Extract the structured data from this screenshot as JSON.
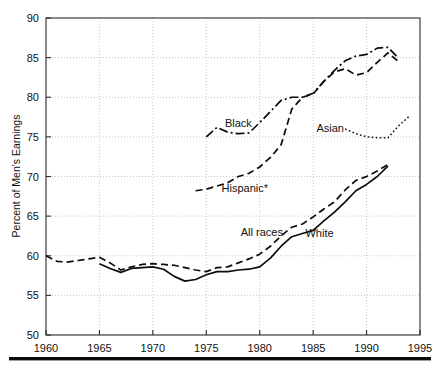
{
  "chart_data": {
    "type": "line",
    "title": "",
    "xlabel": "",
    "ylabel": "Percent of Men's Earnings",
    "xlim": [
      1960,
      1995
    ],
    "ylim": [
      50,
      90
    ],
    "xticks": [
      1960,
      1965,
      1970,
      1975,
      1980,
      1985,
      1990,
      1995
    ],
    "yticks": [
      50,
      55,
      60,
      65,
      70,
      75,
      80,
      85,
      90
    ],
    "grid": true,
    "legend": "inline-annotations",
    "annotations": [
      {
        "text": "Black",
        "x": 1978.0,
        "y": 76.3
      },
      {
        "text": "Hispanic*",
        "x": 1978.6,
        "y": 68.1
      },
      {
        "text": "Asian",
        "x": 1986.6,
        "y": 75.6
      },
      {
        "text": "All races",
        "x": 1980.2,
        "y": 62.5
      },
      {
        "text": "White",
        "x": 1985.6,
        "y": 62.4
      }
    ],
    "series": [
      {
        "name": "All races",
        "style": "dashed",
        "dasharray": "7 4",
        "width": 1.7,
        "x": [
          1960,
          1961,
          1962,
          1963,
          1964,
          1965,
          1966,
          1967,
          1968,
          1969,
          1970,
          1971,
          1972,
          1973,
          1974,
          1975,
          1976,
          1977,
          1978,
          1979,
          1980,
          1981,
          1982,
          1983,
          1984,
          1985,
          1986,
          1987,
          1988,
          1989,
          1990,
          1991,
          1992
        ],
        "y": [
          60.0,
          59.3,
          59.2,
          59.4,
          59.6,
          59.8,
          59.1,
          58.2,
          58.6,
          58.9,
          59.0,
          58.9,
          58.8,
          58.5,
          58.2,
          58.0,
          58.5,
          58.6,
          59.1,
          59.6,
          60.2,
          61.2,
          62.5,
          63.6,
          64.0,
          64.9,
          65.9,
          66.8,
          68.3,
          69.5,
          70.0,
          70.7,
          71.5
        ]
      },
      {
        "name": "White",
        "style": "solid",
        "dasharray": "none",
        "width": 1.7,
        "x": [
          1965,
          1966,
          1967,
          1968,
          1969,
          1970,
          1971,
          1972,
          1973,
          1974,
          1975,
          1976,
          1977,
          1978,
          1979,
          1980,
          1981,
          1982,
          1983,
          1984,
          1985,
          1986,
          1987,
          1988,
          1989,
          1990,
          1991,
          1992
        ],
        "y": [
          59.0,
          58.4,
          57.9,
          58.4,
          58.5,
          58.6,
          58.3,
          57.4,
          56.8,
          57.0,
          57.6,
          58.0,
          58.0,
          58.2,
          58.3,
          58.6,
          59.7,
          61.2,
          62.4,
          62.8,
          63.2,
          64.4,
          65.5,
          66.8,
          68.2,
          69.0,
          70.0,
          71.3
        ]
      },
      {
        "name": "Black",
        "style": "dash-dot",
        "dasharray": "9 3 2 3",
        "width": 1.7,
        "x": [
          1975,
          1976,
          1977,
          1978,
          1979,
          1980,
          1981,
          1982,
          1983,
          1984,
          1985,
          1986,
          1987,
          1988,
          1989,
          1990,
          1991,
          1992,
          1993
        ],
        "y": [
          75.0,
          76.2,
          75.6,
          75.4,
          75.5,
          76.8,
          78.2,
          79.6,
          80.0,
          80.0,
          80.5,
          82.0,
          83.4,
          84.6,
          85.2,
          85.4,
          86.2,
          86.3,
          84.9
        ]
      },
      {
        "name": "Hispanic*",
        "style": "dashed",
        "dasharray": "7 4",
        "width": 1.7,
        "x": [
          1974,
          1975,
          1976,
          1977,
          1978,
          1979,
          1980,
          1981,
          1982,
          1983,
          1984,
          1985,
          1986,
          1987,
          1988,
          1989,
          1990,
          1991,
          1992,
          1993
        ],
        "y": [
          68.2,
          68.4,
          68.8,
          69.2,
          70.0,
          70.4,
          71.2,
          72.4,
          74.0,
          78.5,
          80.0,
          80.4,
          82.0,
          83.2,
          83.6,
          82.8,
          83.1,
          84.4,
          85.6,
          84.5
        ]
      },
      {
        "name": "Asian",
        "style": "dotted",
        "dasharray": "1.6 2.4",
        "width": 1.5,
        "x": [
          1988,
          1989,
          1990,
          1991,
          1992,
          1993,
          1994
        ],
        "y": [
          76.0,
          75.4,
          75.0,
          74.9,
          74.9,
          76.4,
          77.6
        ]
      }
    ]
  },
  "axes": {
    "y_axis_title": "Percent of Men's Earnings",
    "y_tick_labels": [
      "50",
      "55",
      "60",
      "65",
      "70",
      "75",
      "80",
      "85",
      "90"
    ],
    "x_tick_labels": [
      "1960",
      "1965",
      "1970",
      "1975",
      "1980",
      "1985",
      "1990",
      "1995"
    ]
  },
  "colors": {
    "line": "#0c0c0c",
    "grid": "#b9b9b9",
    "frame": "#2b2b2b",
    "background": "#ffffff",
    "rule": "#0c0c0c"
  }
}
